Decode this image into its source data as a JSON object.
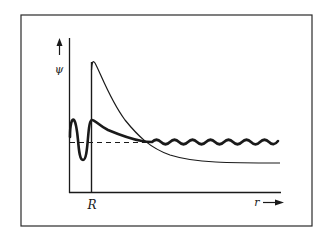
{
  "figure": {
    "y_axis_label": "ψ",
    "x_axis_label": "r",
    "x_marker_label": "R",
    "colors": {
      "ink": "#1a1a1a",
      "frame": "#2a2a2a",
      "background": "#ffffff"
    },
    "curves": [
      {
        "name": "thin-decaying-curve",
        "description": "thin line spiking at R then decaying to an asymptote below baseline"
      },
      {
        "name": "thick-wavefunction",
        "description": "thick oscillating curve: oscillates inside R, decays after R, then small oscillations about baseline"
      },
      {
        "name": "dashed-baseline",
        "description": "dashed horizontal reference line"
      }
    ]
  }
}
